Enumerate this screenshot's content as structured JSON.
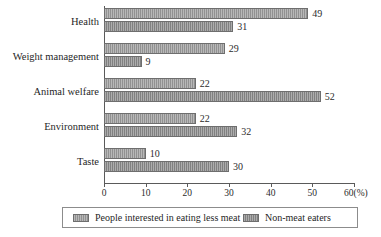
{
  "chart_data": {
    "type": "bar",
    "orientation": "horizontal",
    "title": "",
    "xlabel": "60(%)",
    "ylabel": "",
    "categories": [
      "Health",
      "Weight management",
      "Animal welfare",
      "Environment",
      "Taste"
    ],
    "series": [
      {
        "name": "People interested in eating less meat",
        "values": [
          49,
          29,
          22,
          22,
          10
        ],
        "color": "#9a9a9a"
      },
      {
        "name": "Non-meat eaters",
        "values": [
          31,
          9,
          52,
          32,
          30
        ],
        "color": "#8f8f8f"
      }
    ],
    "xlim": [
      0,
      60
    ],
    "xticks": [
      0,
      10,
      20,
      30,
      40,
      50,
      60
    ],
    "xtick_labels": [
      "0",
      "10",
      "20",
      "30",
      "40",
      "50",
      "60(%)"
    ],
    "grid": false,
    "legend_position": "bottom",
    "value_labels": true
  }
}
